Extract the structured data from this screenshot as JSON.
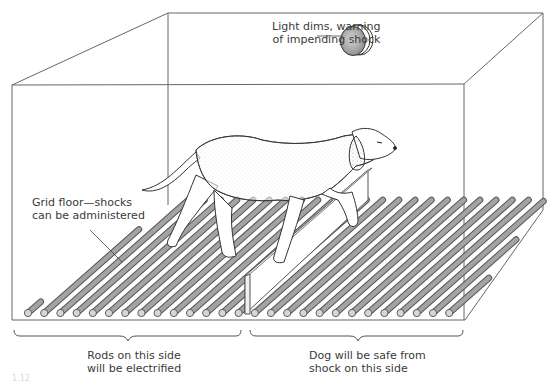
{
  "figure": {
    "colors": {
      "line": "#555555",
      "rod_fill": "#9a9a9a",
      "rod_edge": "#555555",
      "background": "#ffffff",
      "text": "#3a3a3a"
    },
    "labels": {
      "light": {
        "line1": "Light dims, warning",
        "line2": "of impending shock"
      },
      "grid_floor": {
        "line1": "Grid floor—shocks",
        "line2": "can be administered"
      },
      "electrified_side": {
        "line1": "Rods on this side",
        "line2": "will be electrified"
      },
      "safe_side": {
        "line1": "Dog will be safe from",
        "line2": "shock on this side"
      },
      "figure_number": "1.12"
    },
    "elements": [
      "box-frame",
      "warning-light",
      "grid-floor-rods",
      "barrier",
      "dog",
      "left-brace",
      "right-brace"
    ]
  }
}
